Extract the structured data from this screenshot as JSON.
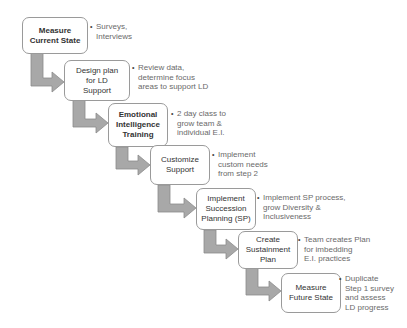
{
  "diagram": {
    "type": "staircase-process",
    "colors": {
      "arrow_fill": "#a8a8a8",
      "arrow_stroke": "#8c8c8c",
      "box_border": "#9a9a9a",
      "box_text": "#333333",
      "note_text": "#6a6a6a"
    },
    "steps": [
      {
        "label": "Measure Current State",
        "lines": [
          "Measure",
          "Current State"
        ],
        "notes": [
          "Surveys,",
          "Interviews"
        ]
      },
      {
        "label": "Design plan for LD Support",
        "lines": [
          "Design plan",
          "for LD",
          "Support"
        ],
        "notes": [
          "Review data,",
          "determine focus",
          "areas to support LD"
        ]
      },
      {
        "label": "Emotional Intelligence Training",
        "lines": [
          "Emotional",
          "Intelligence",
          "Training"
        ],
        "notes": [
          "2 day class to",
          "grow team &",
          "individual E.I."
        ]
      },
      {
        "label": "Customize Support",
        "lines": [
          "Customize",
          "Support"
        ],
        "notes": [
          "Implement",
          "custom needs",
          "from step 2"
        ]
      },
      {
        "label": "Implement Succession Planning (SP)",
        "lines": [
          "Implement",
          "Succession",
          "Planning (SP)"
        ],
        "notes": [
          "Implement SP process,",
          "grow Diversity &",
          "Inclusiveness"
        ]
      },
      {
        "label": "Create Sustainment Plan",
        "lines": [
          "Create",
          "Sustainment",
          "Plan"
        ],
        "notes": [
          "Team creates Plan",
          "for imbedding",
          "E.I. practices"
        ]
      },
      {
        "label": "Measure Future State",
        "lines": [
          "Measure",
          "Future State"
        ],
        "notes": [
          "Duplicate",
          "Step 1 survey",
          "and assess",
          "LD progress"
        ]
      }
    ]
  }
}
